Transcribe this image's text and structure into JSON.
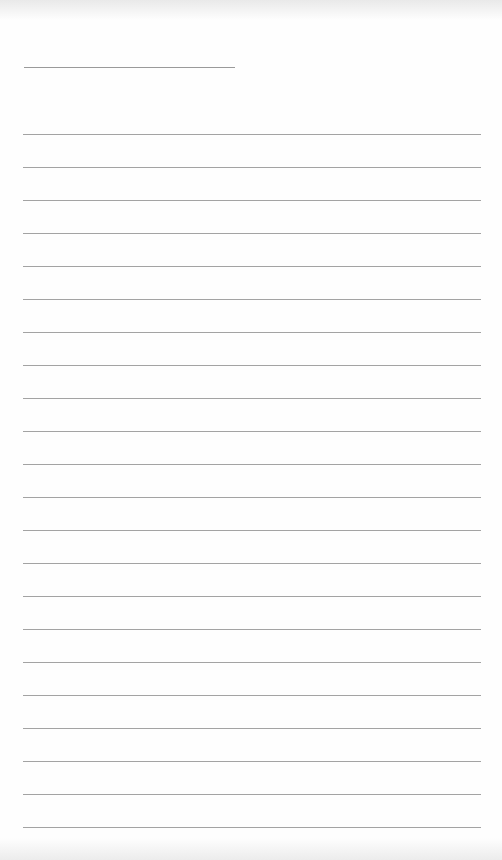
{
  "page": {
    "type": "lined-paper",
    "title_line": {
      "x": 24,
      "y": 67,
      "width": 211
    },
    "rules": {
      "count": 22,
      "start_y": 134,
      "spacing": 33,
      "x": 23,
      "width": 458
    },
    "colors": {
      "paper": "#fefefe",
      "line": "#a3a3a3",
      "title_line": "#9a9a9a"
    }
  }
}
